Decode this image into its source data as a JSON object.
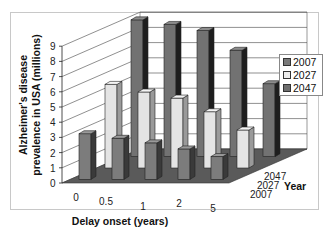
{
  "chart_data": {
    "type": "bar",
    "subtype": "3d-clustered",
    "title": "",
    "xlabel": "Delay onset (years)",
    "ylabel": "Alzheimer's disease prevalence in USA (millions)",
    "zlabel": "Year",
    "categories": [
      "0",
      "0.5",
      "1",
      "2",
      "5"
    ],
    "depth_categories": [
      "2007",
      "2027",
      "2047"
    ],
    "ylim": [
      0,
      9
    ],
    "yticks": [
      "0",
      "1",
      "2",
      "3",
      "4",
      "5",
      "6",
      "7",
      "8",
      "9"
    ],
    "grid": true,
    "legend_position": "right",
    "series": [
      {
        "name": "2007",
        "color": "#7a7a7a",
        "values": [
          3.0,
          2.7,
          2.4,
          2.0,
          1.5
        ]
      },
      {
        "name": "2027",
        "color": "#dedede",
        "values": [
          5.5,
          5.0,
          4.6,
          3.7,
          2.5
        ]
      },
      {
        "name": "2047",
        "color": "#6e6e6e",
        "values": [
          9.0,
          8.7,
          8.3,
          7.0,
          4.8
        ]
      }
    ]
  },
  "labels": {
    "ylabel_line1": "Alzheimer's disease",
    "ylabel_line2": "prevalence in USA (millions)",
    "xlabel": "Delay onset (years)",
    "zlabel": "Year",
    "x0": "0",
    "x1": "0.5",
    "x2": "1",
    "x3": "2",
    "x4": "5",
    "z0": "2007",
    "z1": "2027",
    "z2": "2047",
    "y0": "0",
    "y1": "1",
    "y2": "2",
    "y3": "3",
    "y4": "4",
    "y5": "5",
    "y6": "6",
    "y7": "7",
    "y8": "8",
    "y9": "9"
  },
  "legend": {
    "items": [
      {
        "label": "2007",
        "color": "#7a7a7a"
      },
      {
        "label": "2027",
        "color": "#e6e6e6"
      },
      {
        "label": "2047",
        "color": "#6e6e6e"
      }
    ]
  }
}
